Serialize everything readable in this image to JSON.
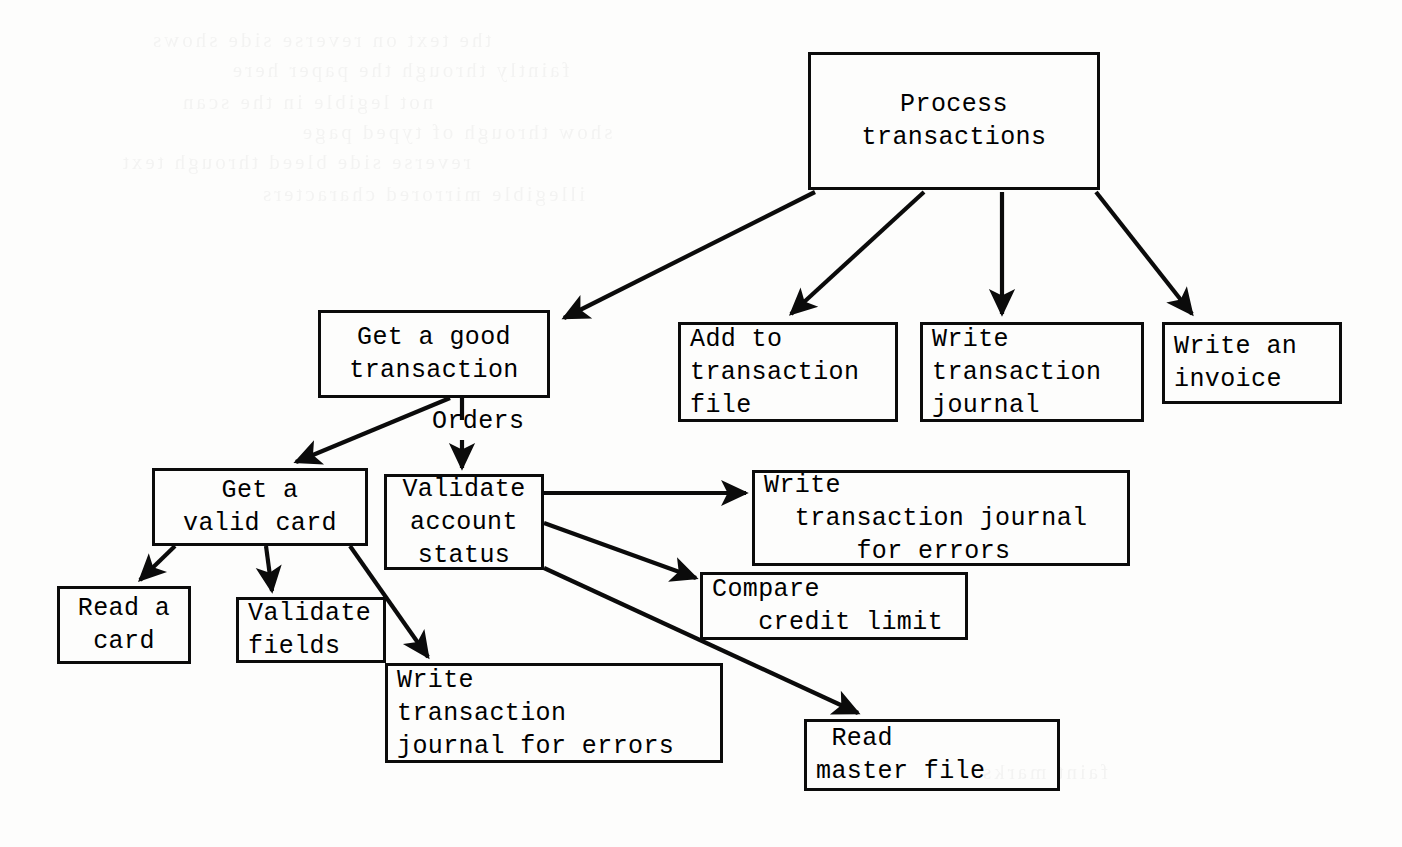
{
  "diagram": {
    "type": "structure-chart",
    "ink_color": "#0b0b0b",
    "paper_color": "#fdfdfc",
    "nodes": [
      {
        "id": "process-transactions",
        "label": "Process transactions",
        "lines": [
          "Process",
          "transactions"
        ],
        "align": "center",
        "level": 0,
        "x": 808,
        "y": 52,
        "w": 292,
        "h": 138
      },
      {
        "id": "get-a-good-transaction",
        "label": "Get a good transaction",
        "lines": [
          "Get a good",
          "transaction"
        ],
        "align": "center",
        "level": 1,
        "x": 318,
        "y": 310,
        "w": 232,
        "h": 88
      },
      {
        "id": "add-to-transaction-file",
        "label": "Add to transaction file",
        "lines": [
          "Add to",
          "transaction",
          "file"
        ],
        "align": "left",
        "level": 1,
        "x": 678,
        "y": 322,
        "w": 220,
        "h": 100
      },
      {
        "id": "write-transaction-journal",
        "label": "Write transaction journal",
        "lines": [
          "Write",
          "transaction",
          "journal"
        ],
        "align": "left",
        "level": 1,
        "x": 920,
        "y": 322,
        "w": 224,
        "h": 100
      },
      {
        "id": "write-an-invoice",
        "label": "Write an invoice",
        "lines": [
          "Write an",
          "invoice"
        ],
        "align": "left",
        "level": 1,
        "x": 1162,
        "y": 322,
        "w": 180,
        "h": 82
      },
      {
        "id": "get-a-valid-card",
        "label": "Get a valid card",
        "lines": [
          "Get a",
          "valid card"
        ],
        "align": "center",
        "level": 2,
        "x": 152,
        "y": 468,
        "w": 216,
        "h": 78
      },
      {
        "id": "validate-account-status",
        "label": "Validate account status",
        "lines": [
          "Validate",
          "account",
          "status"
        ],
        "align": "center",
        "level": 2,
        "x": 384,
        "y": 474,
        "w": 160,
        "h": 96
      },
      {
        "id": "write-transaction-journal-for-errors-top",
        "label": "Write transaction journal for errors",
        "lines": [
          "Write",
          "  transaction journal",
          "      for errors"
        ],
        "align": "left",
        "level": 2,
        "x": 752,
        "y": 470,
        "w": 378,
        "h": 96
      },
      {
        "id": "compare-credit-limit",
        "label": "Compare credit limit",
        "lines": [
          "Compare",
          "   credit limit"
        ],
        "align": "left",
        "level": 3,
        "x": 700,
        "y": 572,
        "w": 268,
        "h": 68
      },
      {
        "id": "read-a-card",
        "label": "Read a card",
        "lines": [
          "Read a",
          "card"
        ],
        "align": "center",
        "level": 3,
        "x": 57,
        "y": 586,
        "w": 134,
        "h": 78
      },
      {
        "id": "validate-fields",
        "label": "Validate fields",
        "lines": [
          "Validate",
          "fields"
        ],
        "align": "left",
        "level": 3,
        "x": 236,
        "y": 597,
        "w": 150,
        "h": 66
      },
      {
        "id": "write-transaction-journal-for-errors-bottom",
        "label": "Write transaction journal for errors",
        "lines": [
          "Write",
          "transaction",
          "journal for errors"
        ],
        "align": "left",
        "level": 3,
        "x": 385,
        "y": 663,
        "w": 338,
        "h": 100
      },
      {
        "id": "read-master-file",
        "label": "Read master file",
        "lines": [
          " Read",
          "master file"
        ],
        "align": "left",
        "level": 3,
        "x": 804,
        "y": 719,
        "w": 256,
        "h": 72
      }
    ],
    "flow_labels": [
      {
        "id": "orders",
        "text": "Orders",
        "x": 432,
        "y": 407
      }
    ],
    "connections": [
      {
        "from": "process-transactions",
        "to": "get-a-good-transaction",
        "style": "arrow"
      },
      {
        "from": "process-transactions",
        "to": "add-to-transaction-file",
        "style": "arrow"
      },
      {
        "from": "process-transactions",
        "to": "write-transaction-journal",
        "style": "arrow"
      },
      {
        "from": "process-transactions",
        "to": "write-an-invoice",
        "style": "arrow"
      },
      {
        "from": "get-a-good-transaction",
        "to": "get-a-valid-card",
        "style": "arrow"
      },
      {
        "from": "get-a-good-transaction",
        "to": "validate-account-status",
        "style": "arrow",
        "data_flow": "Orders"
      },
      {
        "from": "get-a-valid-card",
        "to": "read-a-card",
        "style": "arrow"
      },
      {
        "from": "get-a-valid-card",
        "to": "validate-fields",
        "style": "arrow"
      },
      {
        "from": "get-a-valid-card",
        "to": "write-transaction-journal-for-errors-bottom",
        "style": "arrow"
      },
      {
        "from": "validate-account-status",
        "to": "write-transaction-journal-for-errors-top",
        "style": "arrow"
      },
      {
        "from": "validate-account-status",
        "to": "compare-credit-limit",
        "style": "arrow"
      },
      {
        "from": "validate-account-status",
        "to": "read-master-file",
        "style": "arrow"
      }
    ]
  },
  "ghost_text": {
    "note": "illegible show-through from the reverse side of the scanned page",
    "lines": [
      {
        "x": 150,
        "y": 28,
        "text": "the text on reverse side shows"
      },
      {
        "x": 230,
        "y": 58,
        "text": "faintly through the paper here"
      },
      {
        "x": 180,
        "y": 90,
        "text": "not legible in the scan"
      },
      {
        "x": 300,
        "y": 120,
        "text": "show through of typed page"
      },
      {
        "x": 120,
        "y": 150,
        "text": "reverse side bleed through text"
      },
      {
        "x": 260,
        "y": 182,
        "text": "illegible mirrored characters"
      },
      {
        "x": 980,
        "y": 760,
        "text": "faint marks"
      }
    ]
  }
}
